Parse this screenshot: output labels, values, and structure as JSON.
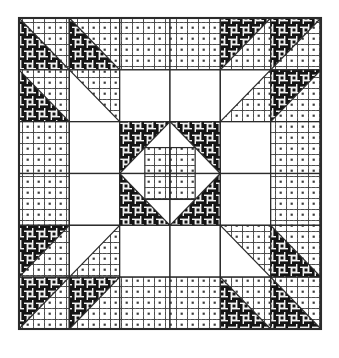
{
  "figure": {
    "name": "quilt-block-pattern",
    "width": 339,
    "height": 358,
    "block": {
      "x": 19,
      "y": 18,
      "width": 302,
      "height": 311
    },
    "grid": {
      "columns": 6,
      "rows": 6
    }
  },
  "colors": {
    "background": "#ffffff",
    "line": "#2b2b2b",
    "dark_fabric_base": "#f2f2f2",
    "dark_fabric_ink": "#1a1a1a",
    "light_fabric_base": "#ffffff",
    "light_fabric_ink": "#555555",
    "plain_fabric": "#ffffff"
  },
  "fabrics": [
    {
      "id": "dark",
      "name": "dark-basketweave-fabric",
      "label": "Dark basketweave print"
    },
    {
      "id": "light",
      "name": "light-dotted-fabric",
      "label": "Light dotted grid print"
    },
    {
      "id": "plain",
      "name": "plain-white-fabric",
      "label": "Plain white solid"
    }
  ],
  "chart_data": {
    "type": "heatmap",
    "xlabel": "",
    "ylabel": "",
    "categories": [
      "c1",
      "c2",
      "c3",
      "c4",
      "c5",
      "c6"
    ],
    "rows": [
      "r1",
      "r2",
      "r3",
      "r4",
      "r5",
      "r6"
    ],
    "legend": [
      "dark",
      "light",
      "plain"
    ],
    "cells": [
      [
        {
          "kind": "hst",
          "fills": [
            "light",
            "dark"
          ],
          "diagonal": "tl-br"
        },
        {
          "kind": "hst",
          "fills": [
            "light",
            "dark"
          ],
          "diagonal": "tl-br"
        },
        {
          "kind": "solid",
          "fills": [
            "light"
          ]
        },
        {
          "kind": "solid",
          "fills": [
            "light"
          ]
        },
        {
          "kind": "hst",
          "fills": [
            "dark",
            "light"
          ],
          "diagonal": "tr-bl"
        },
        {
          "kind": "hst",
          "fills": [
            "dark",
            "light"
          ],
          "diagonal": "tr-bl"
        }
      ],
      [
        {
          "kind": "hst",
          "fills": [
            "light",
            "dark"
          ],
          "diagonal": "tl-br"
        },
        {
          "kind": "hst",
          "fills": [
            "light",
            "plain"
          ],
          "diagonal": "tl-br"
        },
        {
          "kind": "solid",
          "fills": [
            "plain"
          ]
        },
        {
          "kind": "solid",
          "fills": [
            "plain"
          ]
        },
        {
          "kind": "hst",
          "fills": [
            "plain",
            "light"
          ],
          "diagonal": "tr-bl"
        },
        {
          "kind": "hst",
          "fills": [
            "dark",
            "light"
          ],
          "diagonal": "tr-bl"
        }
      ],
      [
        {
          "kind": "solid",
          "fills": [
            "light"
          ]
        },
        {
          "kind": "solid",
          "fills": [
            "plain"
          ]
        },
        {
          "kind": "center",
          "fills": [
            "dark",
            "plain",
            "light"
          ],
          "corner": "tl"
        },
        {
          "kind": "center",
          "fills": [
            "dark",
            "plain",
            "light"
          ],
          "corner": "tr"
        },
        {
          "kind": "solid",
          "fills": [
            "plain"
          ]
        },
        {
          "kind": "solid",
          "fills": [
            "light"
          ]
        }
      ],
      [
        {
          "kind": "solid",
          "fills": [
            "light"
          ]
        },
        {
          "kind": "solid",
          "fills": [
            "plain"
          ]
        },
        {
          "kind": "center",
          "fills": [
            "dark",
            "plain",
            "light"
          ],
          "corner": "bl"
        },
        {
          "kind": "center",
          "fills": [
            "dark",
            "plain",
            "light"
          ],
          "corner": "br"
        },
        {
          "kind": "solid",
          "fills": [
            "plain"
          ]
        },
        {
          "kind": "solid",
          "fills": [
            "light"
          ]
        }
      ],
      [
        {
          "kind": "hst",
          "fills": [
            "dark",
            "light"
          ],
          "diagonal": "tr-bl"
        },
        {
          "kind": "hst",
          "fills": [
            "plain",
            "light"
          ],
          "diagonal": "tr-bl"
        },
        {
          "kind": "solid",
          "fills": [
            "plain"
          ]
        },
        {
          "kind": "solid",
          "fills": [
            "plain"
          ]
        },
        {
          "kind": "hst",
          "fills": [
            "light",
            "plain"
          ],
          "diagonal": "tl-br"
        },
        {
          "kind": "hst",
          "fills": [
            "light",
            "dark"
          ],
          "diagonal": "tl-br"
        }
      ],
      [
        {
          "kind": "hst",
          "fills": [
            "dark",
            "light"
          ],
          "diagonal": "tr-bl"
        },
        {
          "kind": "hst",
          "fills": [
            "dark",
            "light"
          ],
          "diagonal": "tr-bl"
        },
        {
          "kind": "solid",
          "fills": [
            "light"
          ]
        },
        {
          "kind": "solid",
          "fills": [
            "light"
          ]
        },
        {
          "kind": "hst",
          "fills": [
            "light",
            "dark"
          ],
          "diagonal": "tl-br"
        },
        {
          "kind": "hst",
          "fills": [
            "light",
            "dark"
          ],
          "diagonal": "tl-br"
        }
      ]
    ]
  }
}
